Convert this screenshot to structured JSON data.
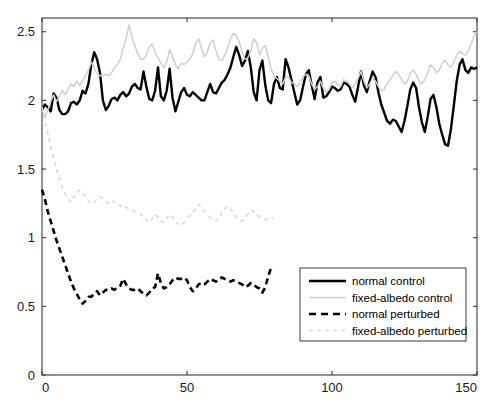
{
  "chart_data": {
    "type": "line",
    "title": "",
    "subtitle": "",
    "xlabel": "",
    "ylabel": "",
    "xlim": [
      0,
      150
    ],
    "ylim": [
      0,
      2.6
    ],
    "xticks": [
      0,
      50,
      100,
      150
    ],
    "xtick_labels": [
      "0",
      "50",
      "100",
      "150"
    ],
    "yticks": [
      0,
      0.5,
      1,
      1.5,
      2,
      2.5
    ],
    "ytick_labels": [
      "0",
      "0.5",
      "1",
      "1.5",
      "2",
      "2.5"
    ],
    "grid": false,
    "legend_position": "lower right",
    "colors": {
      "normal": "#000000",
      "fixed_albedo": "#cfcfcf",
      "axis": "#3a3a3a",
      "background": "#ffffff"
    },
    "series": [
      {
        "name": "normal control",
        "style": "solid",
        "color": "#000000",
        "width": 2.4,
        "x_start": 0,
        "x_step": 1,
        "values": [
          1.93,
          1.97,
          1.95,
          1.92,
          2.05,
          2.02,
          1.93,
          1.9,
          1.9,
          1.92,
          1.98,
          1.99,
          1.97,
          2.0,
          2.07,
          2.05,
          2.12,
          2.26,
          2.35,
          2.3,
          2.2,
          2.0,
          1.93,
          1.96,
          2.01,
          2.02,
          2.0,
          2.04,
          2.06,
          2.03,
          2.05,
          2.1,
          2.12,
          2.09,
          2.08,
          2.21,
          2.1,
          2.01,
          2.0,
          2.07,
          2.24,
          2.03,
          2.0,
          2.07,
          2.23,
          2.02,
          1.92,
          1.99,
          2.06,
          2.09,
          2.04,
          2.03,
          2.06,
          2.04,
          2.02,
          2.0,
          2.0,
          2.06,
          2.12,
          2.06,
          2.05,
          2.09,
          2.13,
          2.15,
          2.19,
          2.24,
          2.32,
          2.39,
          2.33,
          2.25,
          2.29,
          2.36,
          2.24,
          2.06,
          2.0,
          2.22,
          2.29,
          2.11,
          2.0,
          1.98,
          2.12,
          2.17,
          2.09,
          2.08,
          2.3,
          2.24,
          2.15,
          2.06,
          1.97,
          2.0,
          2.1,
          2.19,
          2.22,
          2.11,
          2.01,
          2.13,
          2.17,
          2.02,
          2.03,
          2.06,
          2.1,
          2.09,
          2.07,
          2.08,
          2.13,
          2.12,
          2.1,
          2.04,
          1.99,
          2.1,
          2.21,
          2.11,
          2.06,
          2.14,
          2.21,
          2.17,
          2.06,
          1.97,
          1.91,
          1.85,
          1.83,
          1.86,
          1.85,
          1.81,
          1.77,
          1.85,
          1.96,
          2.08,
          2.13,
          2.09,
          1.95,
          1.84,
          1.77,
          1.88,
          2.01,
          2.04,
          1.95,
          1.83,
          1.75,
          1.68,
          1.67,
          1.79,
          1.96,
          2.14,
          2.26,
          2.3,
          2.22,
          2.2,
          2.24,
          2.23,
          2.24
        ]
      },
      {
        "name": "fixed-albedo control",
        "style": "solid",
        "color": "#cfcfcf",
        "width": 1.5,
        "x_start": 0,
        "x_step": 1,
        "values": [
          1.93,
          1.88,
          1.93,
          1.99,
          2.04,
          1.99,
          2.03,
          2.07,
          2.04,
          2.08,
          2.12,
          2.1,
          2.14,
          2.11,
          2.14,
          2.18,
          2.22,
          2.28,
          2.24,
          2.19,
          2.18,
          2.18,
          2.19,
          2.18,
          2.2,
          2.24,
          2.26,
          2.3,
          2.38,
          2.45,
          2.55,
          2.46,
          2.4,
          2.34,
          2.3,
          2.3,
          2.33,
          2.39,
          2.41,
          2.35,
          2.31,
          2.27,
          2.24,
          2.28,
          2.37,
          2.32,
          2.26,
          2.23,
          2.27,
          2.26,
          2.28,
          2.3,
          2.34,
          2.42,
          2.45,
          2.38,
          2.32,
          2.35,
          2.42,
          2.44,
          2.36,
          2.3,
          2.29,
          2.33,
          2.38,
          2.45,
          2.49,
          2.47,
          2.43,
          2.35,
          2.3,
          2.31,
          2.36,
          2.45,
          2.42,
          2.33,
          2.38,
          2.4,
          2.31,
          2.23,
          2.18,
          2.16,
          2.14,
          2.12,
          2.17,
          2.17,
          2.13,
          2.12,
          2.1,
          2.13,
          2.17,
          2.19,
          2.18,
          2.12,
          2.08,
          2.1,
          2.14,
          2.09,
          2.06,
          2.08,
          2.13,
          2.14,
          2.11,
          2.1,
          2.15,
          2.14,
          2.12,
          2.09,
          2.12,
          2.16,
          2.21,
          2.14,
          2.09,
          2.12,
          2.16,
          2.14,
          2.1,
          2.07,
          2.08,
          2.12,
          2.15,
          2.18,
          2.21,
          2.19,
          2.15,
          2.12,
          2.14,
          2.2,
          2.22,
          2.19,
          2.14,
          2.12,
          2.15,
          2.2,
          2.26,
          2.24,
          2.2,
          2.22,
          2.27,
          2.29,
          2.26,
          2.24,
          2.28,
          2.33,
          2.36,
          2.34,
          2.33,
          2.36,
          2.41,
          2.47,
          2.5
        ]
      },
      {
        "name": "normal perturbed",
        "style": "dashed",
        "color": "#000000",
        "width": 2.6,
        "x_start": 0,
        "x_step": 1,
        "values": [
          1.35,
          1.28,
          1.19,
          1.12,
          1.05,
          0.98,
          0.92,
          0.86,
          0.8,
          0.74,
          0.68,
          0.63,
          0.59,
          0.55,
          0.52,
          0.54,
          0.57,
          0.57,
          0.59,
          0.61,
          0.58,
          0.6,
          0.62,
          0.62,
          0.63,
          0.62,
          0.64,
          0.65,
          0.7,
          0.66,
          0.63,
          0.62,
          0.62,
          0.63,
          0.61,
          0.59,
          0.58,
          0.6,
          0.63,
          0.64,
          0.74,
          0.67,
          0.63,
          0.64,
          0.66,
          0.69,
          0.71,
          0.7,
          0.7,
          0.71,
          0.69,
          0.64,
          0.61,
          0.63,
          0.66,
          0.67,
          0.66,
          0.68,
          0.7,
          0.69,
          0.68,
          0.7,
          0.71,
          0.7,
          0.69,
          0.68,
          0.69,
          0.68,
          0.67,
          0.66,
          0.64,
          0.65,
          0.67,
          0.66,
          0.64,
          0.63,
          0.6,
          0.64,
          0.72,
          0.78,
          0.78
        ]
      },
      {
        "name": "fixed-albedo perturbed",
        "style": "dashed",
        "color": "#dcdcdc",
        "width": 1.7,
        "x_start": 0,
        "x_step": 1,
        "values": [
          1.95,
          1.86,
          1.76,
          1.66,
          1.58,
          1.5,
          1.43,
          1.37,
          1.32,
          1.28,
          1.26,
          1.3,
          1.33,
          1.35,
          1.33,
          1.3,
          1.27,
          1.25,
          1.26,
          1.28,
          1.3,
          1.28,
          1.26,
          1.25,
          1.27,
          1.26,
          1.24,
          1.23,
          1.24,
          1.22,
          1.21,
          1.2,
          1.19,
          1.18,
          1.17,
          1.15,
          1.13,
          1.11,
          1.14,
          1.17,
          1.15,
          1.12,
          1.11,
          1.14,
          1.17,
          1.15,
          1.12,
          1.1,
          1.09,
          1.11,
          1.13,
          1.16,
          1.19,
          1.21,
          1.24,
          1.22,
          1.19,
          1.17,
          1.15,
          1.13,
          1.12,
          1.14,
          1.18,
          1.21,
          1.23,
          1.21,
          1.18,
          1.15,
          1.13,
          1.12,
          1.14,
          1.17,
          1.2,
          1.19,
          1.17,
          1.15,
          1.14,
          1.13,
          1.14,
          1.14,
          1.14
        ]
      }
    ]
  },
  "legend": {
    "entries": [
      {
        "label": "normal control",
        "style": "solid",
        "color": "#000000",
        "width": 2.6
      },
      {
        "label": "fixed-albedo control",
        "style": "solid",
        "color": "#cfcfcf",
        "width": 1.5
      },
      {
        "label": "normal perturbed",
        "style": "dashed",
        "color": "#000000",
        "width": 2.6
      },
      {
        "label": "fixed-albedo perturbed",
        "style": "dashed",
        "color": "#dcdcdc",
        "width": 1.7
      }
    ]
  },
  "axes": {
    "frame_color": "#3a3a3a",
    "tick_color": "#3a3a3a"
  }
}
